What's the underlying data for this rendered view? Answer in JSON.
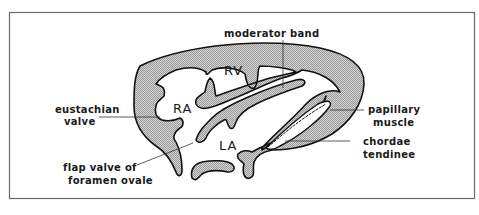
{
  "diagram": {
    "type": "anatomical cross-section",
    "colors": {
      "frame": "#666666",
      "outline": "#1a1a1a",
      "fill": "#c8c8c8",
      "background": "#ffffff"
    },
    "chambers": {
      "rv": "RV",
      "ra": "RA",
      "la": "LA"
    },
    "labels": {
      "moderator_band": "moderator band",
      "eustachian_line1": "eustachian",
      "eustachian_line2": "valve",
      "flap_line1": "flap valve of",
      "flap_line2": "foramen ovale",
      "papillary_line1": "papillary",
      "papillary_line2": "muscle",
      "chordae_line1": "chordae",
      "chordae_line2": "tendinee"
    }
  }
}
